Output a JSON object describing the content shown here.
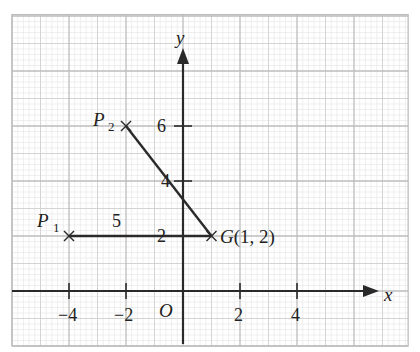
{
  "diagram": {
    "type": "coordinate-grid",
    "origin_px": [
      183,
      291
    ],
    "unit_px": {
      "x": 28.5,
      "y": 27.5
    },
    "grid": {
      "x_min": -6,
      "x_max": 7.9,
      "y_min": -2,
      "y_max": 10.05,
      "minor_step": 0.2,
      "medium_step": 1,
      "major_step": 2,
      "minor_color": "#e4e4e4",
      "medium_color": "#cfcfcf",
      "major_color": "#bdbdbd"
    },
    "axes": {
      "x_label": "x",
      "y_label": "y",
      "origin_label": "O",
      "x_ticks": [
        {
          "value": -4,
          "label": "−4"
        },
        {
          "value": -2,
          "label": "−2"
        },
        {
          "value": 2,
          "label": "2"
        },
        {
          "value": 4,
          "label": "4"
        }
      ],
      "y_ticks": [
        {
          "value": 2,
          "label": "2"
        },
        {
          "value": 4,
          "label": "4"
        },
        {
          "value": 6,
          "label": "6"
        }
      ],
      "color": "#2a2a2a"
    },
    "points": [
      {
        "name": "P",
        "subscript": "1",
        "x": -4,
        "y": 2
      },
      {
        "name": "P",
        "subscript": "2",
        "x": -2,
        "y": 6
      },
      {
        "name": "G",
        "coords_label": "G(1, 2)",
        "x": 1,
        "y": 2
      }
    ],
    "segments": [
      {
        "from": "P1",
        "to": "G",
        "length_label": "5"
      },
      {
        "from": "P2",
        "to": "G",
        "length_label": ""
      }
    ],
    "annotations": {
      "p1_p_label": "P",
      "p1_sub": "1",
      "p2_p_label": "P",
      "p2_sub": "2",
      "g_label": "G(1, 2)",
      "segment_p1g_length": "5"
    }
  }
}
